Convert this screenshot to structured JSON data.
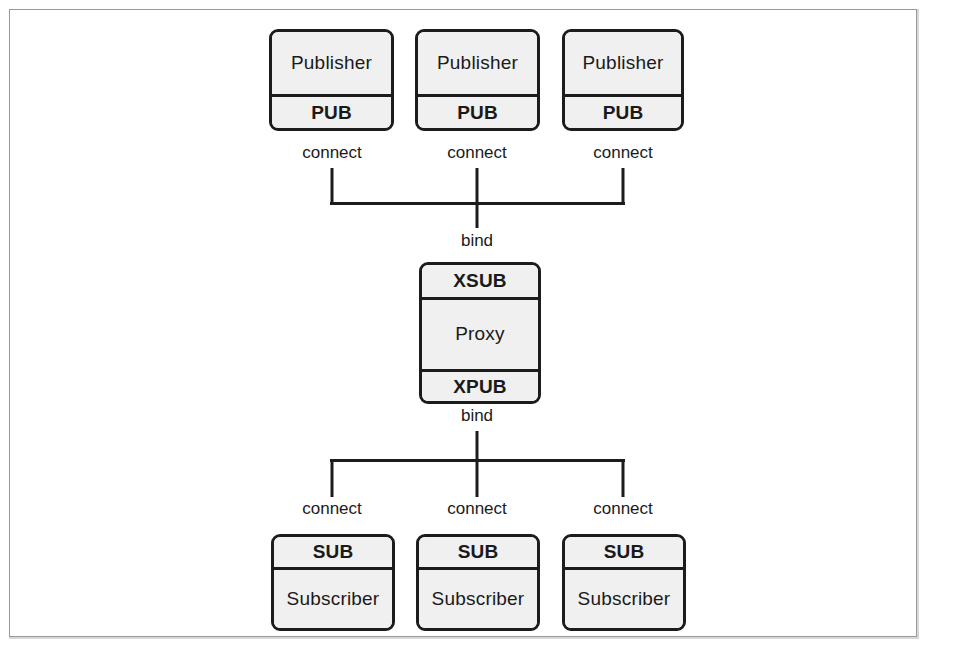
{
  "figure": {
    "colors": {
      "box_fill": "#f0f0f0",
      "box_stroke": "#1c1c1c",
      "frame_stroke": "#9a9a9a",
      "text": "#1a1a1a",
      "background": "#ffffff"
    }
  },
  "publishers": [
    {
      "title": "Publisher",
      "socket": "PUB",
      "edge_label": "connect"
    },
    {
      "title": "Publisher",
      "socket": "PUB",
      "edge_label": "connect"
    },
    {
      "title": "Publisher",
      "socket": "PUB",
      "edge_label": "connect"
    }
  ],
  "proxy": {
    "in_socket": "XSUB",
    "title": "Proxy",
    "out_socket": "XPUB",
    "top_edge_label": "bind",
    "bottom_edge_label": "bind"
  },
  "subscribers": [
    {
      "socket": "SUB",
      "title": "Subscriber",
      "edge_label": "connect"
    },
    {
      "socket": "SUB",
      "title": "Subscriber",
      "edge_label": "connect"
    },
    {
      "socket": "SUB",
      "title": "Subscriber",
      "edge_label": "connect"
    }
  ]
}
